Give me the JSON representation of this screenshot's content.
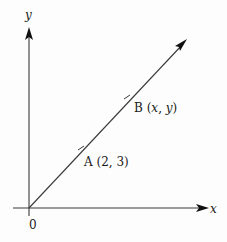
{
  "diagram": {
    "axes": {
      "x_label": "x",
      "y_label": "y",
      "origin_label": "0"
    },
    "line": {
      "description": "line through origin with arrow",
      "points": [
        {
          "name": "A",
          "label": "A (2, 3)",
          "name_text": "A",
          "coords_text": "(2, 3)"
        },
        {
          "name": "B",
          "label": "B (x, y)",
          "name_text": "B",
          "coords_open": "(",
          "coords_x": "x",
          "coords_sep": ", ",
          "coords_y": "y",
          "coords_close": ")"
        }
      ]
    },
    "colors": {
      "line": "#333333",
      "text": "#1a1a1a",
      "background": "#fdfdfd"
    }
  }
}
